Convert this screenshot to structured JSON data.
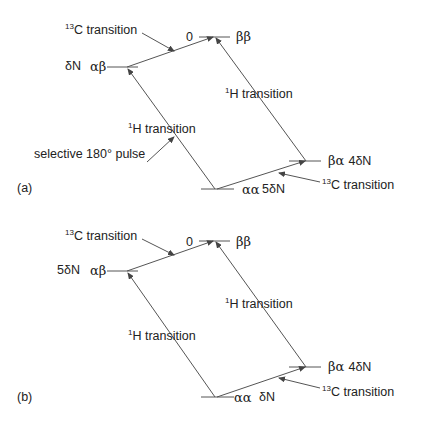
{
  "diagrams": [
    {
      "panel_label": "(a)",
      "levels": {
        "top": {
          "left_label": "0",
          "state": "ββ"
        },
        "left": {
          "left_label": "δN",
          "state": "αβ"
        },
        "bottom": {
          "state": "αα",
          "right_label": "5δN"
        },
        "right": {
          "state": "βα",
          "right_label": "4δN"
        }
      },
      "annotations": {
        "c13_top": {
          "sup": "13",
          "text": "C transition"
        },
        "h1_right": {
          "sup": "1",
          "text": "H transition"
        },
        "h1_left": {
          "sup": "1",
          "text": "H transition"
        },
        "pulse": {
          "text": "selective 180° pulse"
        },
        "c13_bottom": {
          "sup": "13",
          "text": "C transition"
        }
      }
    },
    {
      "panel_label": "(b)",
      "levels": {
        "top": {
          "left_label": "0",
          "state": "ββ"
        },
        "left": {
          "left_label": "5δN",
          "state": "αβ"
        },
        "bottom": {
          "state": "αα",
          "right_label": "δN"
        },
        "right": {
          "state": "βα",
          "right_label": "4δN"
        }
      },
      "annotations": {
        "c13_top": {
          "sup": "13",
          "text": "C transition"
        },
        "h1_right": {
          "sup": "1",
          "text": "H transition"
        },
        "h1_left": {
          "sup": "1",
          "text": "H transition"
        },
        "c13_bottom": {
          "sup": "13",
          "text": "C transition"
        }
      }
    }
  ],
  "colors": {
    "line": "#555555",
    "text": "#222222"
  }
}
